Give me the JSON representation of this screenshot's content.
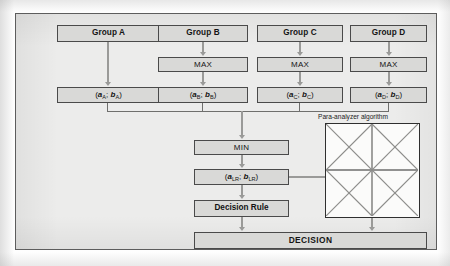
{
  "diagram": {
    "colors": {
      "canvas": "#fefefe",
      "frame_fill": "#ececeb",
      "frame_border": "#5d5d5d",
      "box_fill": "#d9d9d7",
      "box_border": "#4a4a4a",
      "connector": "#9a9a98",
      "bus_line": "#6f6f6d",
      "square_fill": "#fbfbfa",
      "square_border": "#2f2f2f",
      "text": "#141414"
    },
    "groups": [
      {
        "label": "Group A",
        "has_max": false,
        "max_label": "MAX",
        "pair_a": "a",
        "pair_b": "b",
        "subscript": "A"
      },
      {
        "label": "Group B",
        "has_max": true,
        "max_label": "MAX",
        "pair_a": "a",
        "pair_b": "b",
        "subscript": "B"
      },
      {
        "label": "Group C",
        "has_max": true,
        "max_label": "MAX",
        "pair_a": "a",
        "pair_b": "b",
        "subscript": "C"
      },
      {
        "label": "Group D",
        "has_max": true,
        "max_label": "MAX",
        "pair_a": "a",
        "pair_b": "b",
        "subscript": "D"
      }
    ],
    "min_label": "MIN",
    "result_pair": {
      "a": "a",
      "b": "b",
      "subscript": "LR"
    },
    "decision_rule_label": "Decision Rule",
    "decision_label": "DECISION",
    "para_analyzer": {
      "label": "Para-analyzer algorithm",
      "shape": "square-with-midlines-diagonals-and-inscribed-diamond"
    },
    "separator": ";"
  }
}
